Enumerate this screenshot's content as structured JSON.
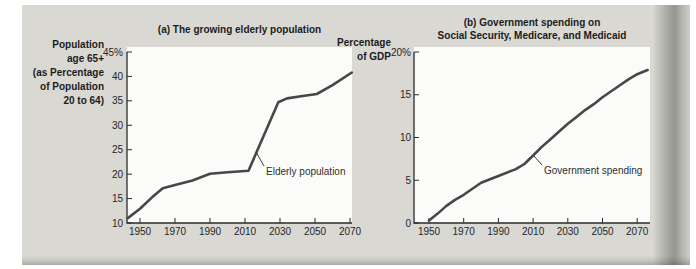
{
  "page": {
    "background": "#ffffff",
    "card_background": "#d9d8d3",
    "line_color": "#474747",
    "axis_color": "#2b2b2b"
  },
  "chart_data": [
    {
      "type": "line",
      "panel": "a",
      "title": "(a) The growing elderly population",
      "ylabel": "Population age 65+ (as Percentage of Population 20 to 64)",
      "ylabel_lines": [
        "Population",
        "age 65+",
        "(as Percentage",
        "of Population",
        "20 to 64)"
      ],
      "annotation": "Elderly population",
      "series": [
        {
          "name": "Elderly population",
          "x": [
            1943,
            1950,
            1957,
            1963,
            1970,
            1980,
            1990,
            2000,
            2012,
            2029,
            2034,
            2043,
            2051,
            2060,
            2071
          ],
          "y": [
            11,
            12.9,
            15.3,
            17.1,
            17.8,
            18.7,
            20.1,
            20.4,
            20.7,
            34.7,
            35.5,
            36,
            36.4,
            38.2,
            40.8
          ]
        }
      ],
      "xticks": [
        1950,
        1970,
        1990,
        2010,
        2030,
        2050,
        2070
      ],
      "xtick_labels": [
        "1950",
        "1970",
        "1990",
        "2010",
        "2030",
        "2050",
        "2070"
      ],
      "yticks": [
        10,
        15,
        20,
        25,
        30,
        35,
        40,
        45
      ],
      "ytick_labels": [
        "10",
        "15",
        "20",
        "25",
        "30",
        "35",
        "40",
        "45%"
      ],
      "xlim": [
        1943,
        2072
      ],
      "ylim": [
        10,
        45
      ],
      "grid": false,
      "legend_position": "annotation-on-line"
    },
    {
      "type": "line",
      "panel": "b",
      "title": "(b) Government spending on Social Security, Medicare, and Medicaid",
      "title_lines": [
        "(b) Government spending on",
        "Social Security, Medicare, and Medicaid"
      ],
      "ylabel": "Percentage of GDP",
      "ylabel_lines": [
        "Percentage",
        "of GDP"
      ],
      "annotation": "Government spending",
      "series": [
        {
          "name": "Government spending",
          "x": [
            1950,
            1955,
            1960,
            1965,
            1970,
            1975,
            1980,
            1990,
            2000,
            2005,
            2010,
            2015,
            2020,
            2025,
            2030,
            2035,
            2040,
            2045,
            2050,
            2055,
            2060,
            2065,
            2070,
            2076
          ],
          "y": [
            0.3,
            1.1,
            2,
            2.7,
            3.3,
            4,
            4.7,
            5.5,
            6.3,
            6.9,
            7.9,
            8.9,
            9.8,
            10.7,
            11.6,
            12.4,
            13.2,
            13.9,
            14.7,
            15.4,
            16.1,
            16.8,
            17.4,
            17.9
          ]
        }
      ],
      "xticks": [
        1950,
        1970,
        1990,
        2010,
        2030,
        2050,
        2070
      ],
      "xtick_labels": [
        "1950",
        "1970",
        "1990",
        "2010",
        "2030",
        "2050",
        "2070"
      ],
      "yticks": [
        0,
        5,
        10,
        15,
        20
      ],
      "ytick_labels": [
        "0",
        "5",
        "10",
        "15",
        "20%"
      ],
      "xlim": [
        1941,
        2079
      ],
      "ylim": [
        0,
        20
      ],
      "grid": false,
      "legend_position": "annotation-on-line"
    }
  ]
}
